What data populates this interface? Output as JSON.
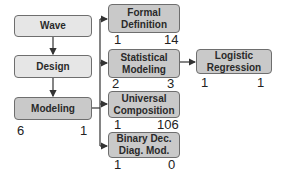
{
  "diagram": {
    "left_column": [
      {
        "id": "wave",
        "label": "Wave"
      },
      {
        "id": "design",
        "label": "Design"
      },
      {
        "id": "modeling",
        "label": "Modeling",
        "left_count": "6",
        "right_count": "1"
      }
    ],
    "right_column": [
      {
        "id": "formal-definition",
        "label": "Formal Definition",
        "left_count": "1",
        "right_count": "14"
      },
      {
        "id": "statistical-modeling",
        "label": "Statistical Modeling",
        "left_count": "2",
        "right_count": "3"
      },
      {
        "id": "universal-composition",
        "label": "Universal Composition",
        "left_count": "1",
        "right_count": "106"
      },
      {
        "id": "binary-dec-diag-mod",
        "label": "Binary Dec. Diag. Mod.",
        "left_count": "1",
        "right_count": "0"
      }
    ],
    "far_right": [
      {
        "id": "logistic-regression",
        "label": "Logistic Regression",
        "left_count": "1",
        "right_count": "1"
      }
    ],
    "edges": [
      [
        "wave",
        "design"
      ],
      [
        "design",
        "modeling"
      ],
      [
        "modeling",
        "formal-definition"
      ],
      [
        "modeling",
        "statistical-modeling"
      ],
      [
        "modeling",
        "universal-composition"
      ],
      [
        "modeling",
        "binary-dec-diag-mod"
      ],
      [
        "statistical-modeling",
        "logistic-regression"
      ]
    ],
    "colors": {
      "light_fill": "#e6e6e6",
      "dark_fill": "#c9c9c9",
      "border": "#6e6e6e",
      "line": "#333333"
    }
  }
}
